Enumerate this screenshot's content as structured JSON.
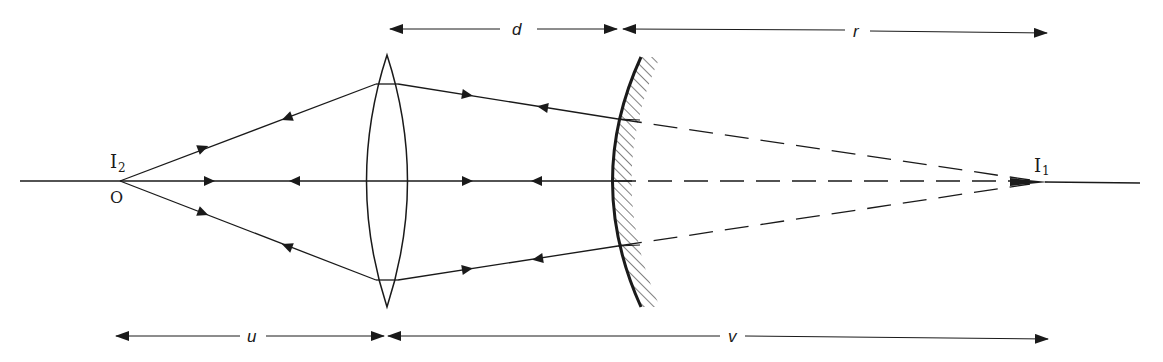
{
  "diagram": {
    "type": "optics-ray-diagram",
    "colors": {
      "ink": "#1a1a1a",
      "background": "#ffffff"
    },
    "points": {
      "object_label": "O",
      "image2_label": "I",
      "image2_sub": "2",
      "image1_label": "I",
      "image1_sub": "1"
    },
    "elements": {
      "lens": "converging-lens",
      "mirror": "concave-mirror"
    },
    "dimensions": {
      "d": "d",
      "r": "r",
      "u": "u",
      "v": "v"
    }
  }
}
